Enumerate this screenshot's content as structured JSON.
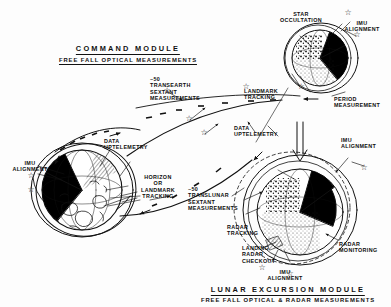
{
  "diagram": {
    "command_module": {
      "heading": "COMMAND  MODULE",
      "subheading": "FREE FALL  OPTICAL  MEASUREMENTS"
    },
    "lunar_excursion_module": {
      "heading": "LUNAR  EXCURSION  MODULE",
      "subheading": "FREE FALL  OPTICAL & RADAR  MEASUREMENTS"
    },
    "labels": [
      {
        "id": "imu-alignment-left",
        "text": "IMU\nALIGNMENT"
      },
      {
        "id": "data-uptelemetry-left",
        "text": "DATA\nUPTELEMETRY"
      },
      {
        "id": "horizon-or-landmark-tracking",
        "text": "HORIZON\nOR\nLANDMARK\nTRACKING"
      },
      {
        "id": "transearth-sextant",
        "text": "~50\nTRANSEARTH\nSEXTANT\nMEASUREMENTS"
      },
      {
        "id": "translunar-sextant",
        "text": "~50\nTRANSLUNAR\nSEXTANT\nMEASUREMENTS"
      },
      {
        "id": "star-occultation",
        "text": "STAR\nOCCULTATION"
      },
      {
        "id": "imu-alignment-topright",
        "text": "IMU\nALIGNMENT"
      },
      {
        "id": "landmark-tracking",
        "text": "LANDMARK\nTRACKING"
      },
      {
        "id": "period-measurement",
        "text": "PERIOD\nMEASUREMENT"
      },
      {
        "id": "data-uptelemetry-right",
        "text": "DATA\nUPTELEMETRY"
      },
      {
        "id": "radar-tracking",
        "text": "RADAR\nTRACKING"
      },
      {
        "id": "landing-radar-checkout",
        "text": "LANDING\nRADAR\nCHECKOUT"
      },
      {
        "id": "imu-alignment-bottom",
        "text": "IMU\nALIGNMENT"
      },
      {
        "id": "radar-monitoring",
        "text": "RADAR\nMONITORING"
      },
      {
        "id": "imu-alignment-right",
        "text": "IMU\nALIGNMENT"
      }
    ],
    "star_markers": 9,
    "colors": {
      "ink": "#111111",
      "paper": "#fdfdfd",
      "shadow": "#000000"
    }
  }
}
